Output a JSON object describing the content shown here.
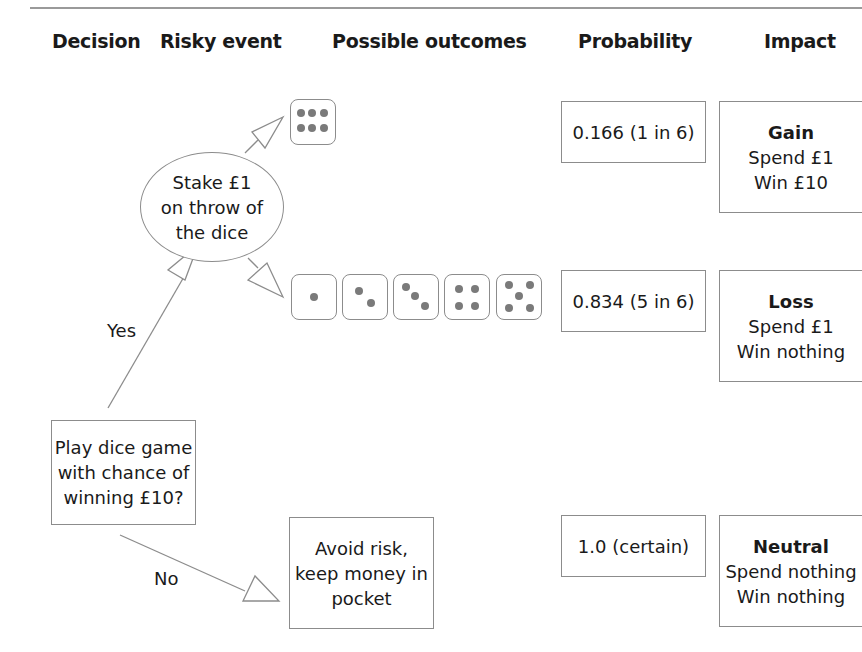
{
  "headers": {
    "decision": "Decision",
    "risky_event": "Risky event",
    "possible_outcomes": "Possible outcomes",
    "probability": "Probability",
    "impact": "Impact"
  },
  "decision_node": {
    "lines": [
      "Play dice game",
      "with chance of",
      "winning £10?"
    ]
  },
  "branches": {
    "yes_label": "Yes",
    "no_label": "No"
  },
  "risky_event_node": {
    "lines": [
      "Stake £1",
      "on throw of",
      "the dice"
    ]
  },
  "outcomes": {
    "win_dice": [
      6
    ],
    "lose_dice": [
      1,
      2,
      3,
      4,
      5
    ],
    "avoid": {
      "lines": [
        "Avoid risk,",
        "keep money in",
        "pocket"
      ]
    }
  },
  "probabilities": {
    "win": "0.166 (1 in 6)",
    "lose": "0.834 (5 in 6)",
    "avoid": "1.0 (certain)"
  },
  "impacts": {
    "gain": {
      "title": "Gain",
      "line1": "Spend £1",
      "line2": "Win £10"
    },
    "loss": {
      "title": "Loss",
      "line1": "Spend £1",
      "line2": "Win nothing"
    },
    "neutral": {
      "title": "Neutral",
      "line1": "Spend nothing",
      "line2": "Win nothing"
    }
  },
  "colors": {
    "line": "#8c8c8c",
    "pip": "#7a7a7a",
    "text": "#1a1a1a"
  }
}
